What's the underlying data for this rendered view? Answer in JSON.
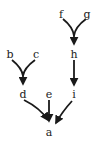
{
  "diagram": {
    "type": "directed-graph",
    "nodes": [
      {
        "id": "f",
        "label": "f",
        "x": 61,
        "y": 14
      },
      {
        "id": "g",
        "label": "g",
        "x": 87,
        "y": 14
      },
      {
        "id": "h",
        "label": "h",
        "x": 74,
        "y": 55
      },
      {
        "id": "b",
        "label": "b",
        "x": 10,
        "y": 55
      },
      {
        "id": "c",
        "label": "c",
        "x": 36,
        "y": 55
      },
      {
        "id": "d",
        "label": "d",
        "x": 23,
        "y": 95
      },
      {
        "id": "e",
        "label": "e",
        "x": 49,
        "y": 95
      },
      {
        "id": "i",
        "label": "i",
        "x": 74,
        "y": 95
      },
      {
        "id": "a",
        "label": "a",
        "x": 49,
        "y": 133
      }
    ],
    "edges": [
      {
        "from": "f",
        "to": "h"
      },
      {
        "from": "g",
        "to": "h"
      },
      {
        "from": "b",
        "to": "d"
      },
      {
        "from": "c",
        "to": "d"
      },
      {
        "from": "h",
        "to": "i"
      },
      {
        "from": "d",
        "to": "a"
      },
      {
        "from": "e",
        "to": "a"
      },
      {
        "from": "i",
        "to": "a"
      }
    ]
  }
}
